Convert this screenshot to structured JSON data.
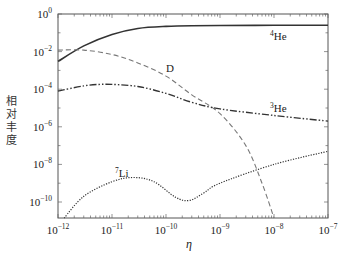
{
  "chart_data": {
    "type": "line",
    "title": "",
    "xlabel": "η",
    "ylabel": "相对丰度",
    "xscale": "log",
    "yscale": "log",
    "xlim": [
      1e-12,
      1e-07
    ],
    "ylim": [
      1.4e-11,
      1
    ],
    "grid": false,
    "legend": "inline curve labels",
    "x_ticks": [
      "10^-12",
      "10^-11",
      "10^-10",
      "10^-9",
      "10^-8",
      "10^-7"
    ],
    "y_ticks": [
      "10^0",
      "10^-2",
      "10^-4",
      "10^-6",
      "10^-8",
      "10^-10"
    ],
    "series": [
      {
        "name": "4He",
        "style": "solid",
        "x": [
          1e-12,
          3e-12,
          1e-11,
          3e-11,
          1e-10,
          3e-10,
          1e-09,
          1e-08,
          1e-07
        ],
        "y": [
          0.003,
          0.02,
          0.08,
          0.17,
          0.22,
          0.24,
          0.245,
          0.25,
          0.25
        ]
      },
      {
        "name": "D",
        "style": "dashed",
        "x": [
          1e-12,
          3e-12,
          1e-11,
          3e-11,
          1e-10,
          3e-10,
          1e-09,
          3e-09,
          6e-09,
          1e-08
        ],
        "y": [
          0.012,
          0.012,
          0.007,
          0.0025,
          0.0005,
          5e-05,
          5e-06,
          1e-07,
          1e-09,
          1e-11
        ]
      },
      {
        "name": "3He",
        "style": "dash-dot-dot",
        "x": [
          1e-12,
          3e-12,
          6e-12,
          1e-11,
          3e-11,
          1e-10,
          3e-10,
          1e-09,
          1e-08,
          1e-07
        ],
        "y": [
          8e-05,
          0.00015,
          0.00018,
          0.00018,
          0.00014,
          6e-05,
          2e-05,
          9e-06,
          4e-06,
          2e-06
        ]
      },
      {
        "name": "7Li",
        "style": "dotted",
        "x": [
          1.3e-12,
          3e-12,
          1e-11,
          2.5e-11,
          6e-11,
          1.5e-10,
          2.7e-10,
          5e-10,
          1e-09,
          1e-08,
          1e-07
        ],
        "y": [
          1.4e-11,
          2e-10,
          1.2e-09,
          2e-09,
          1.2e-09,
          1.8e-10,
          1.2e-10,
          3e-10,
          1e-09,
          1e-08,
          5e-08
        ]
      }
    ],
    "annotations": [
      {
        "text": "4He",
        "x": 1e-08,
        "y": 0.05
      },
      {
        "text": "D",
        "x": 1.2e-10,
        "y": 0.0012
      },
      {
        "text": "3He",
        "x": 1e-08,
        "y": 4e-06
      },
      {
        "text": "7Li",
        "x": 1.5e-11,
        "y": 4e-09
      }
    ]
  },
  "labels": {
    "ylabel": "相对丰度",
    "xlabel": "η",
    "he4": {
      "sup": "4",
      "base": "He"
    },
    "d": {
      "base": "D"
    },
    "he3": {
      "sup": "3",
      "base": "He"
    },
    "li7": {
      "sup": "7",
      "base": "Li"
    }
  },
  "axes": {
    "x_ticks": [
      {
        "base": "10",
        "exp": "−12"
      },
      {
        "base": "10",
        "exp": "−11"
      },
      {
        "base": "10",
        "exp": "−10"
      },
      {
        "base": "10",
        "exp": "−9"
      },
      {
        "base": "10",
        "exp": "−8"
      },
      {
        "base": "10",
        "exp": "−7"
      }
    ],
    "y_ticks": [
      {
        "base": "10",
        "exp": "0"
      },
      {
        "base": "10",
        "exp": "−2"
      },
      {
        "base": "10",
        "exp": "−4"
      },
      {
        "base": "10",
        "exp": "−6"
      },
      {
        "base": "10",
        "exp": "−8"
      },
      {
        "base": "10",
        "exp": "−10"
      }
    ]
  },
  "colors": {
    "axis": "#555555",
    "he4": "#333333",
    "d": "#777777",
    "he3": "#333333",
    "li7": "#333333"
  }
}
